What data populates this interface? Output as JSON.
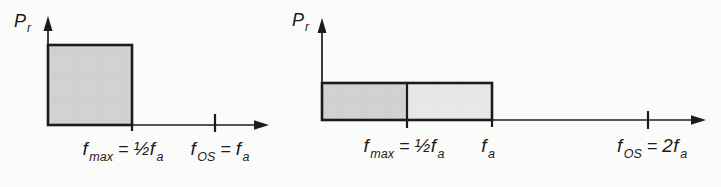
{
  "figure": {
    "description_visible": "",
    "colors": {
      "background": "#fbfbf9",
      "line": "#1c1c1c",
      "fill_dark": "#d3d3d2",
      "fill_light": "#e9e9e7"
    }
  },
  "left_panel": {
    "y_axis_label": {
      "base": "P",
      "sub": "r"
    },
    "fmax_label": {
      "base": "f",
      "sub": "max",
      "eq": "=",
      "value": "½f",
      "value_sub": "a"
    },
    "fos_label": {
      "base": "f",
      "sub": "OS",
      "eq": "=",
      "value": "f",
      "value_sub": "a"
    }
  },
  "right_panel": {
    "y_axis_label": {
      "base": "P",
      "sub": "r"
    },
    "fmax_label": {
      "base": "f",
      "sub": "max",
      "eq": "=",
      "value": "½f",
      "value_sub": "a"
    },
    "fa_label": {
      "base": "f",
      "sub": "a"
    },
    "fos_label": {
      "base": "f",
      "sub": "OS",
      "eq": "=",
      "value": "2f",
      "value_sub": "a"
    }
  }
}
